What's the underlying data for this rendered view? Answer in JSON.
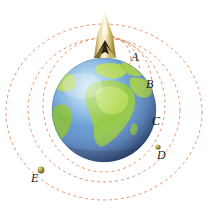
{
  "figure": {
    "type": "physics-orbit-diagram",
    "background_color": "#ffffff",
    "width": 215,
    "height": 208
  },
  "earth": {
    "name": "Earth",
    "center": {
      "x": 104,
      "y": 110
    },
    "radius": 52,
    "ocean_color": "#5a8fd0",
    "ocean_light_color": "#7fb7e3",
    "land_color": "#8ec63f",
    "land_light_color": "#b5d94f",
    "shadow_color": "#2f4f7a",
    "highlight_color": "#cfe8f7"
  },
  "launcher": {
    "name": "rocket-launcher",
    "position": {
      "x": 105,
      "y": 35
    },
    "body_color": "#d9c27a",
    "body_light_color": "#f2e6b8",
    "body_dark_color": "#8f7a33",
    "nozzle_color": "#2b2414"
  },
  "orbit_color": "#e08a5a",
  "orbit_dash": "3 3",
  "orbit_stroke_width": 0.9,
  "satellite_color": "#9a8c2e",
  "satellite_highlight": "#e0d27a",
  "trajectories": [
    {
      "id": "A",
      "label": "A",
      "label_x": 131,
      "label_y": 57,
      "kind": "short-ballistic-arc",
      "has_satellite": false
    },
    {
      "id": "B",
      "label": "B",
      "label_x": 146,
      "label_y": 84,
      "kind": "longer-ballistic-arc",
      "has_satellite": false
    },
    {
      "id": "C",
      "label": "C",
      "label_x": 152,
      "label_y": 121,
      "kind": "near-circular-orbit",
      "has_satellite": false
    },
    {
      "id": "D",
      "label": "D",
      "label_x": 157,
      "label_y": 155,
      "kind": "circular-orbit",
      "has_satellite": true,
      "satellite": {
        "x": 158,
        "y": 147,
        "r": 2.6
      }
    },
    {
      "id": "E",
      "label": "E",
      "label_x": 31,
      "label_y": 178,
      "kind": "large-elliptical-orbit",
      "has_satellite": true,
      "satellite": {
        "x": 41,
        "y": 170,
        "r": 3.4
      }
    }
  ],
  "labels": {
    "a": "A",
    "b": "B",
    "c": "C",
    "d": "D",
    "e": "E"
  }
}
